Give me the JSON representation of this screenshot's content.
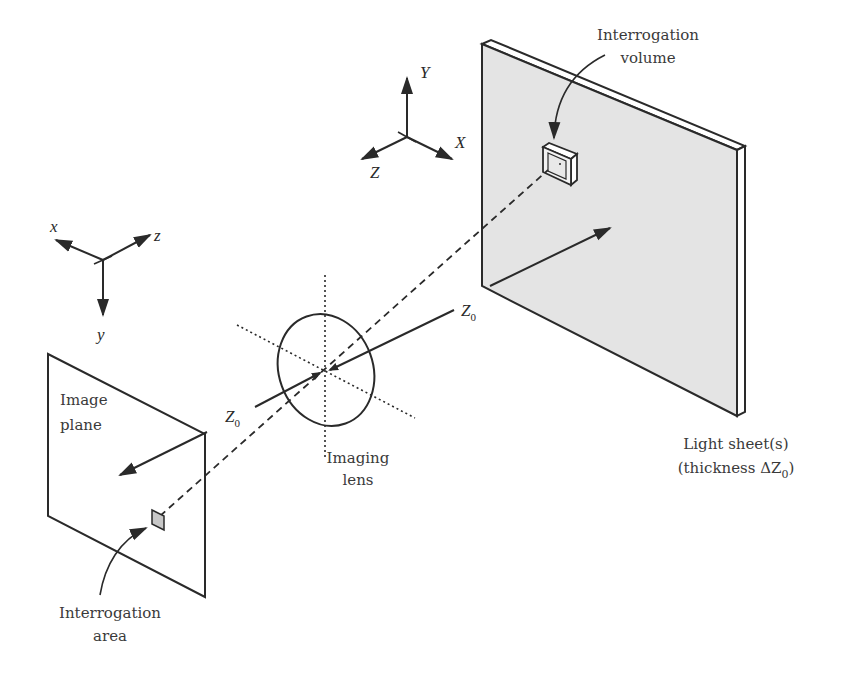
{
  "diagram": {
    "colors": {
      "line": "#2a2a2a",
      "sheet_fill": "#e4e4e4",
      "area_fill": "#c8c8c8",
      "background": "#ffffff"
    },
    "labels": {
      "interrogation_volume_1": "Interrogation",
      "interrogation_volume_2": "volume",
      "world_axis_x": "X",
      "world_axis_y": "Y",
      "world_axis_z": "Z",
      "image_axis_x": "x",
      "image_axis_y": "y",
      "image_axis_z": "z",
      "z0_object": "Z",
      "z0_object_sub": "0",
      "z0_image": "Z",
      "z0_image_sub": "0",
      "image_plane_1": "Image",
      "image_plane_2": "plane",
      "imaging_lens_1": "Imaging",
      "imaging_lens_2": "lens",
      "light_sheet_1": "Light sheet(s)",
      "light_sheet_2_prefix": "(thickness ΔZ",
      "light_sheet_2_sub": "0",
      "light_sheet_2_suffix": ")",
      "interrogation_area_1": "Interrogation",
      "interrogation_area_2": "area"
    },
    "components": [
      "light-sheet",
      "interrogation-volume",
      "world-axes",
      "image-axes",
      "imaging-lens",
      "image-plane",
      "interrogation-area",
      "optical-axis"
    ]
  }
}
